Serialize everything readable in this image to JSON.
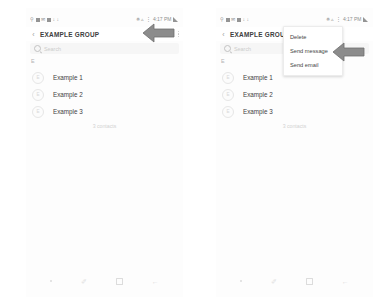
{
  "screens": [
    {
      "id": "group-detail",
      "status_bar": {
        "left_icons": [
          "wifi-call-icon",
          "app-icon",
          "message-icon",
          "gallery-icon",
          "download-icon",
          "download-icon-2"
        ],
        "right_icons": [
          "bluetooth-icon",
          "wifi-icon",
          "vibrate-icon",
          "signal-icon",
          "battery-icon"
        ],
        "time": "4:17 PM"
      },
      "app_bar": {
        "back_label": "‹",
        "title": "EXAMPLE GROUP",
        "edit_label": "Edit",
        "more_label": "more-options"
      },
      "search": {
        "placeholder": "Search"
      },
      "section_index": "E",
      "contacts": [
        {
          "initial": "E",
          "name": "Example 1"
        },
        {
          "initial": "E",
          "name": "Example 2"
        },
        {
          "initial": "E",
          "name": "Example 3"
        }
      ],
      "contacts_count": "3 contacts",
      "nav_bar": {
        "dot_label": "·",
        "pen_label": "✐",
        "home_label": "home",
        "back_label": "←"
      },
      "menu": null
    },
    {
      "id": "group-detail-menu-open",
      "status_bar": {
        "left_icons": [
          "wifi-call-icon",
          "app-icon",
          "message-icon",
          "gallery-icon",
          "download-icon",
          "download-icon-2"
        ],
        "right_icons": [
          "bluetooth-icon",
          "wifi-icon",
          "vibrate-icon",
          "signal-icon",
          "battery-icon"
        ],
        "time": "4:17 PM"
      },
      "app_bar": {
        "back_label": "‹",
        "title": "EXAMPLE GROUP",
        "edit_label": "",
        "more_label": "more-options"
      },
      "search": {
        "placeholder": "Search"
      },
      "section_index": "E",
      "contacts": [
        {
          "initial": "E",
          "name": "Example 1"
        },
        {
          "initial": "E",
          "name": "Example 2"
        },
        {
          "initial": "E",
          "name": "Example 3"
        }
      ],
      "contacts_count": "3 contacts",
      "nav_bar": {
        "dot_label": "·",
        "pen_label": "✐",
        "home_label": "home",
        "back_label": "←"
      },
      "menu": {
        "items": [
          {
            "label": "Delete"
          },
          {
            "label": "Send message"
          },
          {
            "label": "Send email"
          }
        ]
      }
    }
  ],
  "annotations": [
    {
      "id": "arrow-to-more-options",
      "direction": "left",
      "color": "#8c8c8c",
      "outline": "#6f6f6f"
    },
    {
      "id": "arrow-to-send-message",
      "direction": "left",
      "color": "#8c8c8c",
      "outline": "#6f6f6f"
    }
  ]
}
